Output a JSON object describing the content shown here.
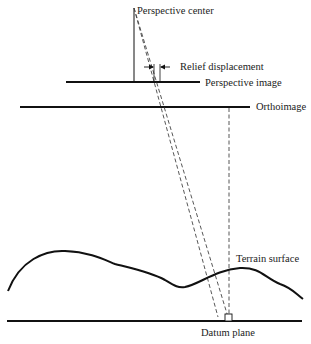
{
  "diagram": {
    "labels": {
      "perspective_center": "Perspective center",
      "relief_displacement": "Relief displacement",
      "perspective_image": "Perspective image",
      "orthoimage": "Orthoimage",
      "terrain_surface": "Terrain surface",
      "datum_plane": "Datum plane"
    },
    "colors": {
      "line": "#111111",
      "dashed": "#444444",
      "background": "#ffffff"
    }
  }
}
